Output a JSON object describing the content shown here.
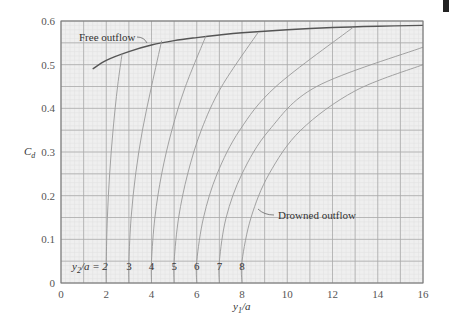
{
  "chart_data": {
    "type": "line",
    "title": "",
    "xlabel": "y1/a",
    "ylabel": "Cd",
    "xlim": [
      0,
      16
    ],
    "ylim": [
      0,
      0.6
    ],
    "grid": true,
    "x_ticks": [
      "0",
      "2",
      "4",
      "6",
      "8",
      "10",
      "12",
      "14",
      "16"
    ],
    "y_ticks": [
      "0",
      "0.1",
      "0.2",
      "0.3",
      "0.4",
      "0.5",
      "0.6"
    ],
    "annotations": [
      "Free outflow",
      "Drowned outflow",
      "y2/a = 2"
    ],
    "series": [
      {
        "name": "Free outflow",
        "x": [
          1.4,
          2,
          3,
          4,
          5,
          6,
          7,
          8,
          10,
          12,
          14,
          16
        ],
        "y": [
          0.49,
          0.51,
          0.53,
          0.545,
          0.555,
          0.562,
          0.568,
          0.573,
          0.58,
          0.585,
          0.588,
          0.59
        ]
      },
      {
        "name": "y2/a = 2",
        "x": [
          2,
          2,
          2.05,
          2.15,
          2.3,
          2.5,
          2.7
        ],
        "y": [
          0,
          0.05,
          0.15,
          0.25,
          0.35,
          0.45,
          0.525
        ]
      },
      {
        "name": "y2/a = 3",
        "x": [
          3,
          3,
          3.1,
          3.3,
          3.6,
          4.0,
          4.45
        ],
        "y": [
          0,
          0.05,
          0.15,
          0.25,
          0.35,
          0.45,
          0.555
        ]
      },
      {
        "name": "y2/a = 4",
        "x": [
          4,
          4,
          4.15,
          4.45,
          4.9,
          5.5,
          6.4
        ],
        "y": [
          0,
          0.05,
          0.15,
          0.25,
          0.35,
          0.45,
          0.565
        ]
      },
      {
        "name": "y2/a = 5",
        "x": [
          5,
          5,
          5.2,
          5.6,
          6.2,
          7.1,
          8.7
        ],
        "y": [
          0,
          0.05,
          0.15,
          0.25,
          0.35,
          0.45,
          0.573
        ]
      },
      {
        "name": "y2/a = 6",
        "x": [
          6,
          6,
          6.3,
          6.9,
          7.9,
          9.5,
          12.9
        ],
        "y": [
          0,
          0.05,
          0.15,
          0.25,
          0.35,
          0.45,
          0.585
        ]
      },
      {
        "name": "y2/a = 7",
        "x": [
          7,
          7,
          7.3,
          8.0,
          9.2,
          11.3,
          16
        ],
        "y": [
          0,
          0.05,
          0.15,
          0.25,
          0.35,
          0.45,
          0.54
        ]
      },
      {
        "name": "y2/a = 8",
        "x": [
          8,
          8,
          8.4,
          9.2,
          10.6,
          13.0,
          16
        ],
        "y": [
          0,
          0.05,
          0.15,
          0.25,
          0.35,
          0.44,
          0.5
        ]
      }
    ],
    "curve_labels": [
      "2",
      "3",
      "4",
      "5",
      "6",
      "7",
      "8"
    ],
    "legend": "none"
  },
  "labels": {
    "free": "Free outflow",
    "drowned": "Drowned outflow",
    "y2a_prefix": "y",
    "y2a_sub": "2",
    "y2a_rest": "/a = 2",
    "xlabel_main": "y",
    "xlabel_sub": "1",
    "xlabel_rest": "/a",
    "ylabel_main": "C",
    "ylabel_sub": "d"
  }
}
